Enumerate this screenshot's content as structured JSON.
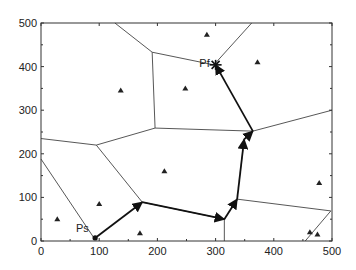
{
  "chart_data": {
    "type": "scatter",
    "title": "",
    "xlabel": "",
    "ylabel": "",
    "xlim": [
      0,
      500
    ],
    "ylim": [
      0,
      500
    ],
    "grid": false,
    "x_ticks": [
      0,
      100,
      200,
      300,
      400,
      500
    ],
    "y_ticks": [
      0,
      100,
      200,
      300,
      400,
      500
    ],
    "x_tick_labels": [
      "0",
      "100",
      "200",
      "300",
      "400",
      "500"
    ],
    "y_tick_labels": [
      "0",
      "100",
      "200",
      "300",
      "400",
      "500"
    ],
    "obstacles": {
      "name": "triangle markers (Voronoi sites)",
      "points": [
        [
          28,
          50
        ],
        [
          100,
          85
        ],
        [
          137,
          345
        ],
        [
          170,
          18
        ],
        [
          212,
          160
        ],
        [
          248,
          350
        ],
        [
          285,
          473
        ],
        [
          372,
          410
        ],
        [
          478,
          133
        ],
        [
          462,
          20
        ],
        [
          475,
          15
        ]
      ]
    },
    "voronoi_edges": [
      [
        [
          0,
          188
        ],
        [
          91,
          7
        ]
      ],
      [
        [
          0,
          235
        ],
        [
          95,
          220
        ]
      ],
      [
        [
          95,
          220
        ],
        [
          174,
          89
        ]
      ],
      [
        [
          95,
          220
        ],
        [
          196,
          259
        ]
      ],
      [
        [
          174,
          89
        ],
        [
          315,
          50
        ]
      ],
      [
        [
          315,
          50
        ],
        [
          315,
          0
        ]
      ],
      [
        [
          337,
          96
        ],
        [
          498,
          69
        ]
      ],
      [
        [
          498,
          69
        ],
        [
          454,
          0
        ]
      ],
      [
        [
          196,
          259
        ],
        [
          191,
          433
        ]
      ],
      [
        [
          191,
          433
        ],
        [
          127,
          500
        ]
      ],
      [
        [
          191,
          433
        ],
        [
          297,
          404
        ]
      ],
      [
        [
          297,
          404
        ],
        [
          362,
          500
        ]
      ],
      [
        [
          196,
          259
        ],
        [
          364,
          252
        ]
      ],
      [
        [
          364,
          252
        ],
        [
          500,
          300
        ]
      ]
    ],
    "path": {
      "name": "planned path",
      "start_label": "Ps",
      "end_label": "Pf",
      "points": [
        [
          93,
          7
        ],
        [
          174,
          89
        ],
        [
          315,
          50
        ],
        [
          337,
          96
        ],
        [
          349,
          233
        ],
        [
          364,
          252
        ],
        [
          300,
          404
        ]
      ]
    },
    "annotations": [
      {
        "text": "Ps",
        "x": 60,
        "y": 20
      },
      {
        "text": "Pf",
        "x": 272,
        "y": 398
      }
    ]
  }
}
